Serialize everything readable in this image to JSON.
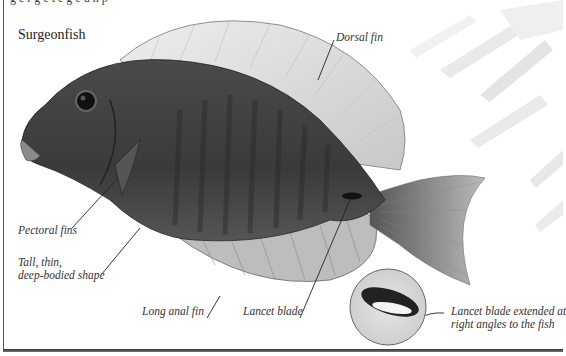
{
  "page": {
    "top_text_cutoff": "g  e    r  g  c        t        e g  e  u  n     p",
    "title": "Surgeonfish"
  },
  "labels": {
    "dorsal_fin": "Dorsal fin",
    "pectoral_fins": "Pectoral fins",
    "body_shape_line1": "Tall, thin,",
    "body_shape_line2": "deep-bodied shape",
    "long_anal_fin": "Long anal fin",
    "lancet_blade": "Lancet blade",
    "inset_line1": "Lancet blade extended at",
    "inset_line2": "right angles to the fish"
  },
  "colors": {
    "body": "#3a3a3a",
    "fin_light": "#d9d9d9",
    "text": "#333333",
    "frame": "#555555"
  }
}
